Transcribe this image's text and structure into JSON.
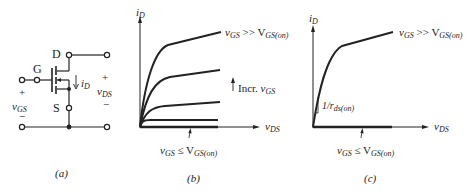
{
  "figure": {
    "panel_a": {
      "caption": "(a)",
      "terminals": {
        "drain": "D",
        "gate": "G",
        "source": "S"
      },
      "current_label": {
        "main": "i",
        "sub": "D"
      },
      "vgs": {
        "plus": "+",
        "main": "v",
        "sub": "GS",
        "minus": "−"
      },
      "vds": {
        "plus": "+",
        "main": "v",
        "sub": "DS",
        "minus": "−"
      }
    },
    "panel_b": {
      "caption": "(b)",
      "y_axis": {
        "main": "i",
        "sub": "D"
      },
      "x_axis": {
        "main": "v",
        "sub": "DS"
      },
      "top_curve_label": {
        "main": "v",
        "sub": "GS",
        "op": " >> V",
        "sub2": "GS(on)"
      },
      "arrow_label": {
        "text": "Incr. ",
        "main": "v",
        "sub": "GS"
      },
      "bottom_label": {
        "main": "v",
        "sub": "GS",
        "op": " ≤ V",
        "sub2": "GS(on)"
      }
    },
    "panel_c": {
      "caption": "(c)",
      "y_axis": {
        "main": "i",
        "sub": "D"
      },
      "x_axis": {
        "main": "v",
        "sub": "DS"
      },
      "top_curve_label": {
        "main": "v",
        "sub": "GS",
        "op": " >> V",
        "sub2": "GS(on)"
      },
      "slope_label": {
        "main": "1/r",
        "sub": "ds(on)"
      },
      "bottom_label": {
        "main": "v",
        "sub": "GS",
        "op": " ≤ V",
        "sub2": "GS(on)"
      }
    },
    "colors": {
      "ink": "#222222",
      "background": "#ffffff"
    }
  }
}
